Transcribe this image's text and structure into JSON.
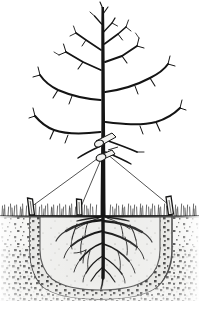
{
  "figure": {
    "medium": "black and white pen-and-ink line illustration",
    "background_color": "#ffffff",
    "ink_color": "#111111",
    "width": 199,
    "height": 313
  },
  "palette": {
    "ink": "#141414",
    "trunk": "#151515",
    "paper": "#ffffff",
    "grass_ink": "#2a2a2a",
    "soil_light": "#e8e8e6",
    "soil_mid": "#cfcfcb",
    "soil_dark": "#3a3a3a",
    "backfill": "#ececeb",
    "stipple": "#2b2b2b",
    "collar_fill": "#f2f2f0",
    "stake_fill": "#f4f4f2",
    "guy_wire": "#333333"
  },
  "parts": {
    "canopy": {
      "label": "Bare deciduous canopy",
      "branch_count": 14,
      "leaf_state": "dormant, leafless",
      "top_y": 4,
      "spread_left_x": 32,
      "spread_right_x": 186
    },
    "trunk": {
      "label": "Central leader trunk",
      "top_y": 6,
      "base_y": 216,
      "center_x": 103,
      "width_top": 2,
      "width_base": 6
    },
    "collar": {
      "label": "Protective trunk collar / tie guard",
      "y": 155,
      "count": 2,
      "note": "white padded band where guy wires attach"
    },
    "guy_wires": {
      "label": "Guy wires",
      "count": 3,
      "anchor_y": 155,
      "anchor_x": 104,
      "targets": [
        {
          "name": "left-stake",
          "x": 30,
          "y": 208
        },
        {
          "name": "center-stake",
          "x": 79,
          "y": 210
        },
        {
          "name": "right-stake",
          "x": 170,
          "y": 206
        }
      ]
    },
    "stakes": {
      "label": "Angled ground anchor stakes",
      "count": 3,
      "material": "wooden peg",
      "positions": [
        30,
        79,
        170
      ]
    },
    "ground_line": {
      "label": "Soil surface grade line",
      "y": 216
    },
    "grass": {
      "label": "Turf / grass at grade",
      "blade_height": 12,
      "style": "short vertical hatching"
    },
    "planting_hole": {
      "label": "Planting hole with loosened backfill",
      "top_left_x": 30,
      "top_right_x": 172,
      "bottom_y": 297,
      "shape": "broad rounded-bottom basin"
    },
    "root_ball": {
      "label": "Fibrous root system",
      "root_count": 16,
      "depth_y": 285,
      "spread_left_x": 48,
      "spread_right_x": 158
    },
    "native_soil": {
      "label": "Undisturbed native soil cross-section",
      "texture": "stippled dots"
    }
  },
  "annotations": {
    "caption": "Staking a newly planted tree: three guy wires run from padded trunk collars to angled stakes set outside the planting hole.",
    "alt_text": "Pen and ink cross-section drawing of a young leafless tree. Three guy wires run from a padded collar on the trunk down to three short angled wooden stakes driven into the grass. Below grade, the trunk continues into a wide fibrous root system spreading through a rounded planting hole filled with loose backfill, surrounded by stippled native soil."
  }
}
